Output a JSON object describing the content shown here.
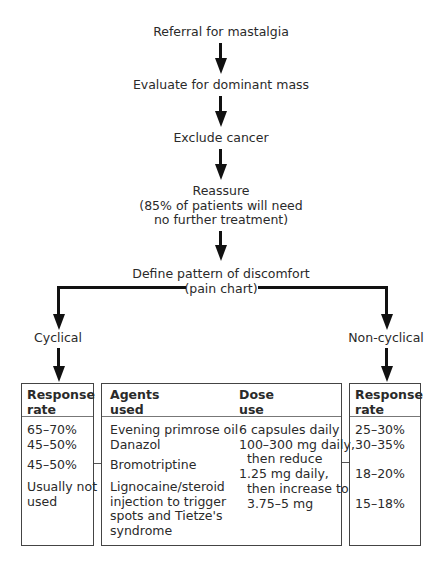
{
  "flow": {
    "steps": [
      "Referral for mastalgia",
      "Evaluate for dominant mass",
      "Exclude cancer",
      "Reassure\n(85% of patients will need\nno further treatment)",
      "Define pattern of discomfort\n(pain chart)"
    ],
    "branches": {
      "left": "Cyclical",
      "right": "Non-cyclical"
    }
  },
  "tables": {
    "cyclical_response": {
      "header": "Response\nrate",
      "rows": [
        "65–70%\n45–50%",
        "45–50%",
        "Usually not\nused"
      ]
    },
    "agents": {
      "header_agents": "Agents\nused",
      "header_dose": "Dose\nuse",
      "agents": [
        "Evening primrose oil\nDanazol",
        "Bromotriptine",
        "Lignocaine/steroid\ninjection to trigger\nspots and Tietze's\nsyndrome"
      ],
      "doses": [
        "6 capsules daily\n100–300 mg daily,\n  then reduce\n1.25 mg daily,\n  then increase to\n  3.75–5 mg"
      ]
    },
    "noncyclical_response": {
      "header": "Response\nrate",
      "rows": [
        "25–30%\n30–35%",
        "18–20%",
        "15–18%"
      ]
    }
  }
}
